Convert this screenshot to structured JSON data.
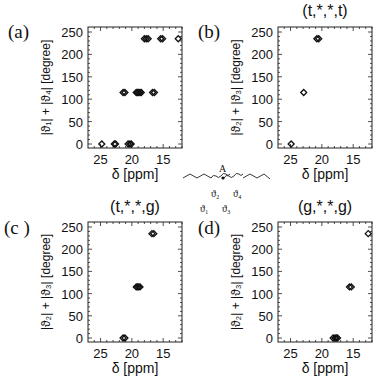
{
  "figure": {
    "molecule": {
      "atom_label": "A",
      "angle_labels": [
        "ϑ1",
        "ϑ2",
        "ϑ3",
        "ϑ4"
      ],
      "angle_labels_display": [
        "ϑ₁",
        "ϑ₂",
        "ϑ₃",
        "ϑ₄"
      ]
    }
  },
  "chart_data": [
    {
      "type": "scatter",
      "panel_label": "(a)",
      "title": "",
      "xlabel": "δ [ppm]",
      "ylabel": "|ϑ₁| + |ϑ₄| [degree]",
      "xlim": [
        27,
        12
      ],
      "ylim": [
        -10,
        260
      ],
      "xticks": [
        25,
        20,
        15
      ],
      "yticks": [
        0,
        50,
        100,
        150,
        200,
        250
      ],
      "marker": "diamond-open",
      "points": [
        {
          "x": 24.8,
          "y": 0
        },
        {
          "x": 22.8,
          "y": 0
        },
        {
          "x": 22.6,
          "y": 0
        },
        {
          "x": 20.6,
          "y": 0
        },
        {
          "x": 20.3,
          "y": 0
        },
        {
          "x": 20.1,
          "y": 0
        },
        {
          "x": 21.4,
          "y": 115
        },
        {
          "x": 21.1,
          "y": 115
        },
        {
          "x": 19.3,
          "y": 115
        },
        {
          "x": 19.1,
          "y": 115
        },
        {
          "x": 18.9,
          "y": 115
        },
        {
          "x": 18.7,
          "y": 115
        },
        {
          "x": 18.5,
          "y": 115
        },
        {
          "x": 16.7,
          "y": 115
        },
        {
          "x": 16.4,
          "y": 115
        },
        {
          "x": 18.0,
          "y": 235
        },
        {
          "x": 17.7,
          "y": 235
        },
        {
          "x": 17.4,
          "y": 235
        },
        {
          "x": 15.4,
          "y": 235
        },
        {
          "x": 15.1,
          "y": 235
        },
        {
          "x": 12.6,
          "y": 235
        }
      ]
    },
    {
      "type": "scatter",
      "panel_label": "(b)",
      "title": "(t,*,*,t)",
      "xlabel": "δ [ppm]",
      "ylabel": "|ϑ₂| + |ϑ₃| [degree]",
      "xlim": [
        27,
        12
      ],
      "ylim": [
        -10,
        260
      ],
      "xticks": [
        25,
        20,
        15
      ],
      "yticks": [
        0,
        50,
        100,
        150,
        200,
        250
      ],
      "marker": "diamond-open",
      "points": [
        {
          "x": 24.9,
          "y": 0
        },
        {
          "x": 22.9,
          "y": 115
        },
        {
          "x": 20.8,
          "y": 235
        },
        {
          "x": 20.5,
          "y": 235
        }
      ]
    },
    {
      "type": "scatter",
      "panel_label": "(c )",
      "title": "(t,*,*,g)",
      "xlabel": "δ [ppm]",
      "ylabel": "|ϑ₂| + |ϑ₃| [degree]",
      "xlim": [
        27,
        12
      ],
      "ylim": [
        -10,
        260
      ],
      "xticks": [
        25,
        20,
        15
      ],
      "yticks": [
        0,
        50,
        100,
        150,
        200,
        250
      ],
      "marker": "diamond-open",
      "points": [
        {
          "x": 21.4,
          "y": 0
        },
        {
          "x": 21.1,
          "y": 0
        },
        {
          "x": 19.3,
          "y": 115
        },
        {
          "x": 19.1,
          "y": 115
        },
        {
          "x": 18.9,
          "y": 115
        },
        {
          "x": 18.7,
          "y": 115
        },
        {
          "x": 16.8,
          "y": 235
        },
        {
          "x": 16.5,
          "y": 235
        }
      ]
    },
    {
      "type": "scatter",
      "panel_label": "(d)",
      "title": "(g,*,*,g)",
      "xlabel": "δ [ppm]",
      "ylabel": "|ϑ₂| + |ϑ₃| [degree]",
      "xlim": [
        27,
        12
      ],
      "ylim": [
        -10,
        260
      ],
      "xticks": [
        25,
        20,
        15
      ],
      "yticks": [
        0,
        50,
        100,
        150,
        200,
        250
      ],
      "marker": "diamond-open",
      "points": [
        {
          "x": 18.2,
          "y": 0
        },
        {
          "x": 17.9,
          "y": 0
        },
        {
          "x": 17.7,
          "y": 0
        },
        {
          "x": 17.5,
          "y": 0
        },
        {
          "x": 15.6,
          "y": 115
        },
        {
          "x": 15.3,
          "y": 115
        },
        {
          "x": 12.6,
          "y": 235
        }
      ]
    }
  ]
}
